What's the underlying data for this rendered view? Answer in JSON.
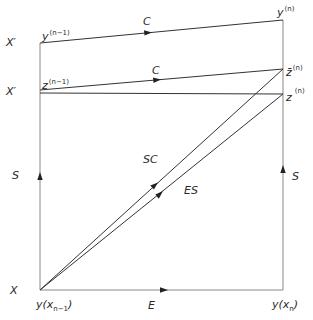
{
  "figure": {
    "left_axis_labels": {
      "x_prime_top": "X′",
      "x_prime_mid": "X′",
      "s_left": "S",
      "x_bottom": "X"
    },
    "right_labels": {
      "s_right": "S"
    },
    "points": {
      "y_n_minus_1": {
        "base": "y",
        "sup": "(n−1)"
      },
      "y_n": {
        "base": "y",
        "sup": "(n)"
      },
      "z_n_minus_1": {
        "base": "z",
        "sup": "(n−1)"
      },
      "zbar_n": {
        "base": "z̄",
        "sup": "(n)"
      },
      "z_n": {
        "base": "z",
        "sup": "(n)"
      }
    },
    "edge_labels": {
      "c_top": "C",
      "c_mid": "C",
      "sc": "SC",
      "es": "ES",
      "e_bottom": "E"
    },
    "bottom_labels": {
      "y_x_n_minus_1": {
        "base": "y(x",
        "sub": "n−1",
        "close": ")"
      },
      "y_x_n": {
        "base": "y(x",
        "sub": "n",
        "close": ")"
      }
    },
    "colors": {
      "line": "#333333",
      "axis_line": "#888888",
      "text": "#2a2a2a",
      "background": "#ffffff"
    }
  }
}
